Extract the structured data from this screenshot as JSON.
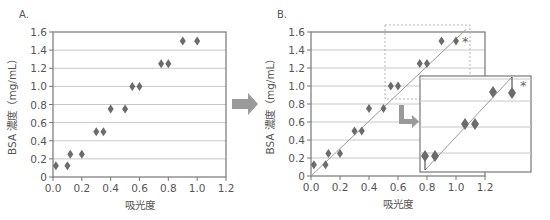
{
  "chart_data": [
    {
      "panel_label": "A.",
      "type": "scatter",
      "xlabel": "吸光度",
      "ylabel": "BSA 濃度（mg/mL）",
      "xlim": [
        0,
        1.2
      ],
      "ylim": [
        0,
        1.6
      ],
      "xticks": [
        "0.0",
        "0.2",
        "0.4",
        "0.6",
        "0.8",
        "1.0",
        "1.2"
      ],
      "yticks": [
        "0",
        "0.2",
        "0.4",
        "0.6",
        "0.8",
        "1.0",
        "1.2",
        "1.4",
        "1.6"
      ],
      "grid": "horizontal",
      "series": [
        {
          "name": "BSA standard",
          "x": [
            0.02,
            0.1,
            0.12,
            0.2,
            0.3,
            0.35,
            0.4,
            0.5,
            0.55,
            0.6,
            0.75,
            0.8,
            0.9,
            1.0
          ],
          "y": [
            0.125,
            0.125,
            0.25,
            0.25,
            0.5,
            0.5,
            0.75,
            0.75,
            1.0,
            1.0,
            1.25,
            1.25,
            1.5,
            1.5
          ]
        }
      ]
    },
    {
      "panel_label": "B.",
      "type": "scatter",
      "xlabel": "吸光度",
      "ylabel": "BSA 濃度（mg/mL）",
      "xlim": [
        0,
        1.2
      ],
      "ylim": [
        0,
        1.6
      ],
      "xticks": [
        "0.0",
        "0.2",
        "0.4",
        "0.6",
        "0.8",
        "1.0",
        "1.2"
      ],
      "yticks": [
        "0",
        "0.2",
        "0.4",
        "0.6",
        "0.8",
        "1.0",
        "1.2",
        "1.4",
        "1.6"
      ],
      "grid": "horizontal",
      "series": [
        {
          "name": "BSA standard",
          "x": [
            0.02,
            0.1,
            0.12,
            0.2,
            0.3,
            0.35,
            0.4,
            0.5,
            0.55,
            0.6,
            0.75,
            0.8,
            0.9,
            1.0
          ],
          "y": [
            0.125,
            0.125,
            0.25,
            0.25,
            0.5,
            0.5,
            0.75,
            0.75,
            1.0,
            1.0,
            1.25,
            1.25,
            1.5,
            1.5
          ]
        }
      ],
      "fit_line": {
        "x": [
          0,
          1.07
        ],
        "y": [
          0,
          1.63
        ]
      },
      "annotation": "*",
      "inset": {
        "note": "magnified view of dashed region",
        "annotation": "*"
      }
    }
  ],
  "labels": {
    "panel_a": "A.",
    "panel_b": "B.",
    "xlabel": "吸光度",
    "ylabel": "BSA 濃度（mg/mL）",
    "asterisk": "*"
  }
}
